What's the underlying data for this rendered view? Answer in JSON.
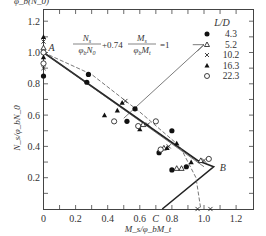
{
  "chart_data": {
    "type": "scatter",
    "title": "",
    "xlabel": "M_s/φ_bM_t",
    "ylabel": "N_s/φ_bN_0",
    "top_label": "φ_b(N_0)",
    "xlim": [
      0,
      1.3
    ],
    "ylim": [
      0,
      1.25
    ],
    "x_ticks": [
      "0",
      "0.2",
      "0.4",
      "0.6",
      "0.8",
      "1.0",
      "1.2"
    ],
    "y_ticks": [
      "0.2",
      "0.4",
      "0.6",
      "0.8",
      "1.0",
      "1.2"
    ],
    "grid": false,
    "legend_position": "upper right",
    "legend": {
      "title": "L/D",
      "entries": [
        {
          "marker": "filled-circle",
          "label": "4.3"
        },
        {
          "marker": "open-triangle",
          "label": "5.2"
        },
        {
          "marker": "cross",
          "label": "10.2"
        },
        {
          "marker": "filled-triangle",
          "label": "16.3"
        },
        {
          "marker": "open-circle",
          "label": "22.3"
        }
      ]
    },
    "equation": {
      "text": "N_s/φ_bN_0 + 0.74 M_s/φ_bM_t = 1",
      "numerator1": "N",
      "numerator1_sub": "s",
      "denominator1": "φ",
      "denominator1_sub": "b",
      "denominator1_tail": "N",
      "denominator1_tail_sub": "0",
      "coef": "+0.74",
      "numerator2": "M",
      "numerator2_sub": "s",
      "denominator2": "φ",
      "denominator2_sub": "b",
      "denominator2_tail": "M",
      "denominator2_tail_sub": "t",
      "rhs": "=1"
    },
    "point_labels": [
      {
        "label": "A",
        "x": 0.0,
        "y": 1.0
      },
      {
        "label": "B",
        "x": 1.06,
        "y": 0.27
      },
      {
        "label": "C",
        "x": 0.74,
        "y": 0.0
      }
    ],
    "lines": [
      {
        "name": "design-curve-ABC",
        "style": "solid-thick",
        "points": [
          [
            0,
            1.0
          ],
          [
            0.96,
            0.31
          ],
          [
            1.06,
            0.27
          ],
          [
            0.74,
            0.0
          ]
        ]
      },
      {
        "name": "fit-line",
        "style": "solid-thin",
        "points": [
          [
            0,
            1.0
          ],
          [
            1.0,
            0.27
          ]
        ]
      },
      {
        "name": "dashed-trend",
        "style": "dashed",
        "points": [
          [
            0,
            1.0
          ],
          [
            0.3,
            0.86
          ],
          [
            0.6,
            0.62
          ],
          [
            0.85,
            0.4
          ],
          [
            0.95,
            0.2
          ],
          [
            0.98,
            0.0
          ]
        ]
      },
      {
        "name": "equation-leader",
        "style": "solid-thin",
        "points": [
          [
            0.5,
            0.58
          ],
          [
            1.0,
            1.05
          ]
        ]
      }
    ],
    "series": [
      {
        "name": "4.3",
        "marker": "filled-circle",
        "points": [
          [
            0,
            0.85
          ],
          [
            0.28,
            0.86
          ],
          [
            0.27,
            0.81
          ],
          [
            0.57,
            0.64
          ],
          [
            0.52,
            0.56
          ],
          [
            0.8,
            0.5
          ],
          [
            0.72,
            0.36
          ],
          [
            0.8,
            0.25
          ],
          [
            0.89,
            0.27
          ]
        ]
      },
      {
        "name": "5.2",
        "marker": "open-triangle",
        "points": [
          [
            0,
            1.03
          ],
          [
            0.62,
            0.54
          ],
          [
            0.75,
            0.39
          ],
          [
            0.83,
            0.26
          ],
          [
            0.86,
            0.26
          ],
          [
            0.98,
            0.31
          ]
        ]
      },
      {
        "name": "10.2",
        "marker": "cross",
        "points": [
          [
            0,
            0.9
          ],
          [
            0,
            1.07
          ],
          [
            0.51,
            0.69
          ],
          [
            0.96,
            0.0
          ],
          [
            1.04,
            0.0
          ],
          [
            0.65,
            0.54
          ],
          [
            0.78,
            0.4
          ],
          [
            1.0,
            0.31
          ]
        ]
      },
      {
        "name": "16.3",
        "marker": "filled-triangle",
        "points": [
          [
            0,
            1.1
          ],
          [
            0,
            0.97
          ],
          [
            0.46,
            0.63
          ],
          [
            0.49,
            0.68
          ],
          [
            0.38,
            0.6
          ],
          [
            0.6,
            0.51
          ],
          [
            0.77,
            0.39
          ],
          [
            0.83,
            0.42
          ],
          [
            0.92,
            0.3
          ]
        ]
      },
      {
        "name": "22.3",
        "marker": "open-circle",
        "points": [
          [
            0,
            1.0
          ],
          [
            0,
            0.93
          ],
          [
            0.44,
            0.56
          ],
          [
            0.59,
            0.53
          ],
          [
            0.7,
            0.56
          ],
          [
            0.73,
            0.38
          ],
          [
            1.03,
            0.32
          ]
        ]
      }
    ]
  }
}
